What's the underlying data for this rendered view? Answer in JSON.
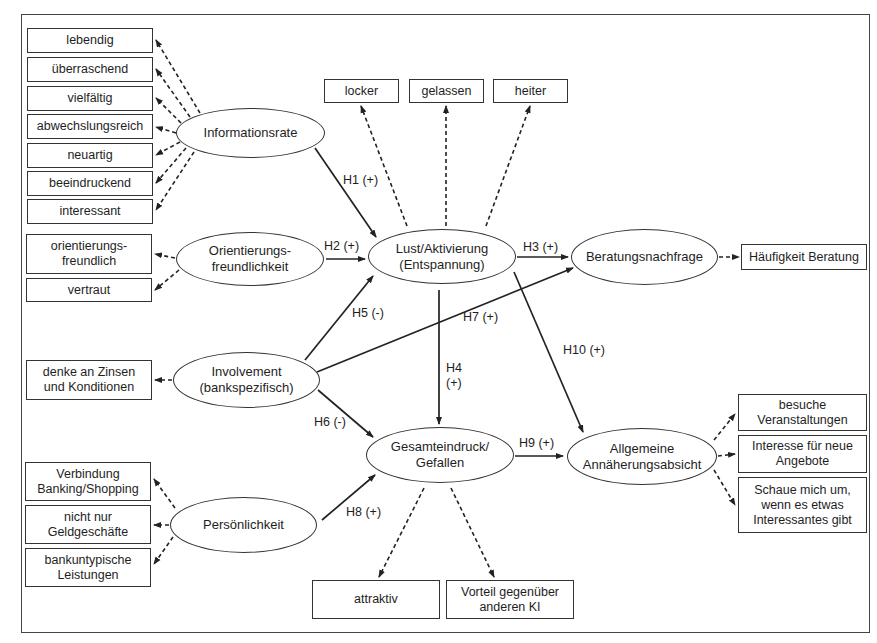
{
  "diagram": {
    "constructs": {
      "informationsrate": "Informationsrate",
      "orientierung": "Orientierungs-\nfreundlichkeit",
      "involvement": "Involvement\n(bankspezifisch)",
      "persoenlichkeit": "Persönlichkeit",
      "lust": "Lust/Aktivierung\n(Entspannung)",
      "beratung": "Beratungsnachfrage",
      "gesamteindruck": "Gesamteindruck/\nGefallen",
      "annaeherung": "Allgemeine\nAnnäherungsabsicht"
    },
    "indicators": {
      "informationsrate": [
        "lebendig",
        "überraschend",
        "vielfältig",
        "abwechslungsreich",
        "neuartig",
        "beeindruckend",
        "interessant"
      ],
      "orientierung": [
        "orientierungs-\nfreundlich",
        "vertraut"
      ],
      "involvement": [
        "denke an Zinsen\nund Konditionen"
      ],
      "persoenlichkeit": [
        "Verbindung\nBanking/Shopping",
        "nicht nur\nGeldgeschäfte",
        "bankuntypische\nLeistungen"
      ],
      "lust": [
        "locker",
        "gelassen",
        "heiter"
      ],
      "beratung": [
        "Häufigkeit Beratung"
      ],
      "gesamteindruck": [
        "attraktiv",
        "Vorteil gegenüber\nanderen KI"
      ],
      "annaeherung": [
        "besuche\nVeranstaltungen",
        "Interesse für neue\nAngebote",
        "Schaue mich um,\nwenn es etwas\nInteressantes gibt"
      ]
    },
    "hypotheses": {
      "h1": "H1 (+)",
      "h2": "H2 (+)",
      "h3": "H3 (+)",
      "h4": "H4\n(+)",
      "h5": "H5 (-)",
      "h6": "H6 (-)",
      "h7": "H7 (+)",
      "h8": "H8 (+)",
      "h9": "H9 (+)",
      "h10": "H10 (+)"
    },
    "colors": {
      "line": "#222222",
      "border": "#333333",
      "background": "#ffffff"
    }
  }
}
